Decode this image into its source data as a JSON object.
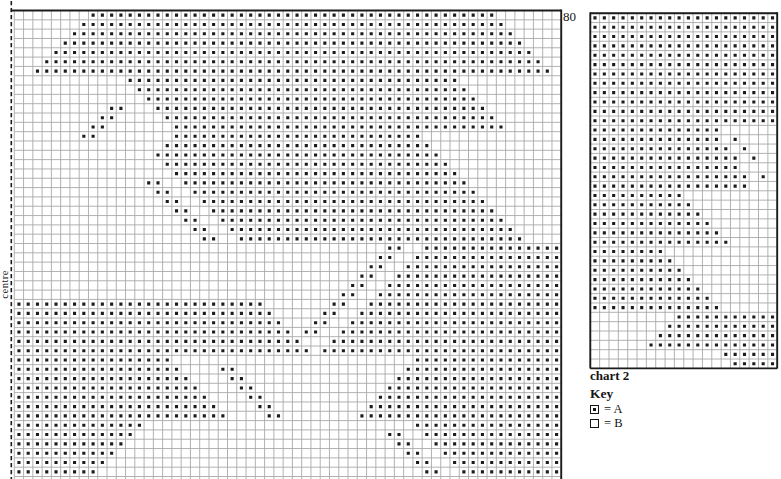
{
  "page_type": "scanned knitting colourwork chart page",
  "colors": {
    "paper": "#ffffff",
    "ink": "#1c1c1c",
    "grid_line": "#a9a9a9"
  },
  "labels": {
    "top_row_number": "80",
    "centre": "centre",
    "chart2_caption": "chart 2",
    "key_title": "Key"
  },
  "key": {
    "items": [
      {
        "symbol": "dotted-square",
        "meaning": "A",
        "label": "= A"
      },
      {
        "symbol": "empty-square",
        "meaning": "B",
        "label": "= B"
      }
    ]
  },
  "chart_data": [
    {
      "type": "heatmap",
      "name": "main chart (left half from centre line)",
      "top_row_label": "80",
      "left_edge": "dashed centre line",
      "cols": 59,
      "rows": 51,
      "cell_values": {
        "A": "dotted square",
        "B": "blank square"
      },
      "encoding": "rows_rle = alternating run lengths per row, starting with B (blank), first entry may be 0; top row first; bottom row cut off by page edge",
      "rows_rle": [
        [
          8,
          44,
          7
        ],
        [
          7,
          46,
          6
        ],
        [
          6,
          48,
          5
        ],
        [
          5,
          50,
          4
        ],
        [
          4,
          52,
          3
        ],
        [
          3,
          54,
          2
        ],
        [
          2,
          56,
          1
        ],
        [
          12,
          36,
          11
        ],
        [
          13,
          36,
          10
        ],
        [
          14,
          36,
          9
        ],
        [
          10,
          2,
          3,
          36,
          8
        ],
        [
          9,
          2,
          5,
          36,
          7
        ],
        [
          8,
          2,
          7,
          36,
          6
        ],
        [
          7,
          2,
          8,
          27,
          15
        ],
        [
          16,
          29,
          14
        ],
        [
          15,
          31,
          13
        ],
        [
          16,
          31,
          12
        ],
        [
          17,
          31,
          11
        ],
        [
          14,
          2,
          2,
          31,
          10
        ],
        [
          15,
          2,
          2,
          31,
          9
        ],
        [
          16,
          2,
          2,
          31,
          8
        ],
        [
          17,
          2,
          2,
          31,
          7
        ],
        [
          18,
          2,
          2,
          31,
          6
        ],
        [
          19,
          2,
          2,
          31,
          5
        ],
        [
          20,
          2,
          2,
          31,
          4
        ],
        [
          40,
          2,
          2,
          15
        ],
        [
          39,
          2,
          2,
          16
        ],
        [
          38,
          2,
          2,
          17
        ],
        [
          37,
          2,
          2,
          18
        ],
        [
          36,
          2,
          2,
          19
        ],
        [
          35,
          2,
          2,
          20
        ],
        [
          0,
          27,
          7,
          2,
          2,
          21
        ],
        [
          0,
          28,
          5,
          2,
          2,
          22
        ],
        [
          0,
          29,
          3,
          2,
          2,
          23
        ],
        [
          0,
          30,
          1,
          2,
          2,
          24
        ],
        [
          0,
          31,
          3,
          25
        ],
        [
          0,
          32,
          1,
          26
        ],
        [
          0,
          17,
          26,
          16
        ],
        [
          0,
          18,
          4,
          2,
          18,
          17
        ],
        [
          0,
          19,
          4,
          2,
          16,
          18
        ],
        [
          0,
          20,
          4,
          2,
          14,
          19
        ],
        [
          0,
          21,
          4,
          2,
          12,
          20
        ],
        [
          0,
          22,
          4,
          2,
          10,
          21
        ],
        [
          0,
          23,
          4,
          2,
          8,
          22
        ],
        [
          0,
          14,
          29,
          16
        ],
        [
          0,
          13,
          27,
          2,
          2,
          15
        ],
        [
          0,
          12,
          29,
          2,
          2,
          14
        ],
        [
          0,
          11,
          31,
          2,
          2,
          13
        ],
        [
          0,
          10,
          33,
          2,
          2,
          12
        ],
        [
          0,
          9,
          35,
          2,
          2,
          11
        ],
        [
          0,
          8,
          40,
          11
        ]
      ]
    },
    {
      "type": "heatmap",
      "name": "chart 2",
      "cols": 20,
      "rows": 38,
      "cell_values": {
        "A": "dotted square",
        "B": "blank square"
      },
      "encoding": "rows_rle = alternating run lengths per row, starting with B (blank), first entry may be 0; top row first",
      "rows_rle": [
        [
          0,
          20
        ],
        [
          0,
          20
        ],
        [
          0,
          20
        ],
        [
          0,
          20
        ],
        [
          0,
          20
        ],
        [
          0,
          20
        ],
        [
          0,
          20
        ],
        [
          0,
          20
        ],
        [
          0,
          20
        ],
        [
          0,
          20
        ],
        [
          0,
          20
        ],
        [
          0,
          20
        ],
        [
          0,
          14,
          6
        ],
        [
          0,
          14,
          1,
          1,
          4
        ],
        [
          0,
          15,
          1,
          1,
          3
        ],
        [
          0,
          16,
          1,
          1,
          2
        ],
        [
          0,
          16,
          4
        ],
        [
          0,
          17,
          1,
          1,
          1
        ],
        [
          0,
          17,
          3
        ],
        [
          0,
          10,
          10
        ],
        [
          0,
          11,
          9
        ],
        [
          0,
          12,
          8
        ],
        [
          0,
          13,
          7
        ],
        [
          0,
          14,
          6
        ],
        [
          0,
          15,
          5
        ],
        [
          0,
          8,
          12
        ],
        [
          0,
          9,
          11
        ],
        [
          0,
          10,
          10
        ],
        [
          0,
          11,
          9
        ],
        [
          0,
          12,
          8
        ],
        [
          0,
          13,
          7
        ],
        [
          0,
          14,
          6
        ],
        [
          9,
          11
        ],
        [
          8,
          12
        ],
        [
          7,
          13
        ],
        [
          6,
          14
        ],
        [
          14,
          6
        ],
        [
          15,
          5
        ]
      ]
    }
  ]
}
